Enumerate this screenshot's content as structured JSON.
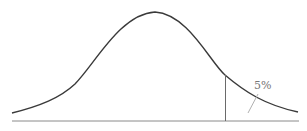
{
  "diagram": {
    "type": "normal-distribution",
    "tail_label": "5%",
    "tail_side": "right",
    "colors": {
      "curve": "#3a3a3a",
      "axis": "#8a8a8a",
      "cutoff": "#6a6a6a",
      "label": "#777777"
    }
  }
}
